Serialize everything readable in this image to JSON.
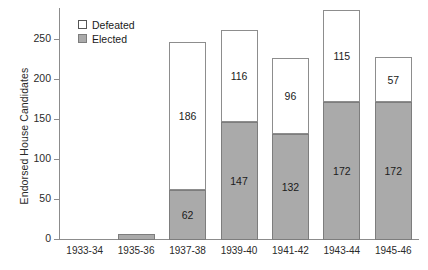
{
  "chart_data": {
    "type": "bar",
    "title": "",
    "xlabel": "",
    "ylabel": "Endorsed House Candidates",
    "ylim": [
      0,
      290
    ],
    "yticks": [
      0,
      50,
      100,
      150,
      200,
      250
    ],
    "grid": false,
    "stacked": true,
    "legend_position": "upper-left-inside",
    "categories": [
      "1933-34",
      "1935-36",
      "1937-38",
      "1939-40",
      "1941-42",
      "1943-44",
      "1945-46"
    ],
    "series": [
      {
        "name": "Elected",
        "color": "#aaaaaa",
        "values": [
          0,
          8,
          62,
          147,
          132,
          172,
          172
        ],
        "labels": [
          "",
          "",
          "62",
          "147",
          "132",
          "172",
          "172"
        ]
      },
      {
        "name": "Defeated",
        "color": "#ffffff",
        "values": [
          0,
          0,
          186,
          116,
          96,
          115,
          57
        ],
        "labels": [
          "",
          "",
          "186",
          "116",
          "96",
          "115",
          "57"
        ]
      }
    ],
    "totals": [
      0,
      8,
      248,
      263,
      228,
      287,
      229
    ]
  },
  "legend": {
    "items": [
      {
        "label": "Defeated",
        "swatch": "white-square-swatch"
      },
      {
        "label": "Elected",
        "swatch": "gray-square-swatch"
      }
    ]
  },
  "axes": {
    "y_title": "Endorsed House Candidates",
    "y_tick_labels": [
      "0",
      "50",
      "100",
      "150",
      "200",
      "250"
    ],
    "x_tick_labels": [
      "1933-34",
      "1935-36",
      "1937-38",
      "1939-40",
      "1941-42",
      "1943-44",
      "1945-46"
    ]
  },
  "caption": {
    "fragment": ""
  }
}
